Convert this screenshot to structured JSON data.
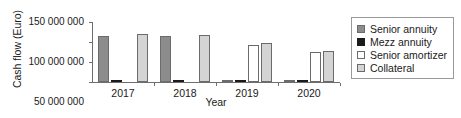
{
  "chart_data": {
    "type": "bar",
    "title": "",
    "xlabel": "Year",
    "ylabel": "Cash flow (Euro)",
    "categories": [
      "2017",
      "2018",
      "2019",
      "2020"
    ],
    "ylim": [
      0,
      150000000
    ],
    "yticks": [
      0,
      50000000,
      100000000,
      150000000
    ],
    "ytick_labels": [
      "0",
      "50 000 000",
      "100 000 000",
      "150 000 000"
    ],
    "grid": false,
    "legend_position": "right",
    "series": [
      {
        "name": "Senior annuity",
        "color": "#8c8c8c",
        "values": [
          115000000,
          114000000,
          2500000,
          1500000
        ]
      },
      {
        "name": "Mezz annuity",
        "color": "#1a1a1a",
        "values": [
          2500000,
          2500000,
          2500000,
          2000000
        ]
      },
      {
        "name": "Senior amortizer",
        "color": "#ffffff",
        "values": [
          0,
          0,
          92000000,
          75000000
        ]
      },
      {
        "name": "Collateral",
        "color": "#d4d4d4",
        "values": [
          120000000,
          118000000,
          97000000,
          78000000
        ]
      }
    ]
  },
  "legend": {
    "items": [
      {
        "label": "Senior annuity"
      },
      {
        "label": "Mezz annuity"
      },
      {
        "label": "Senior amortizer"
      },
      {
        "label": "Collateral"
      }
    ]
  }
}
